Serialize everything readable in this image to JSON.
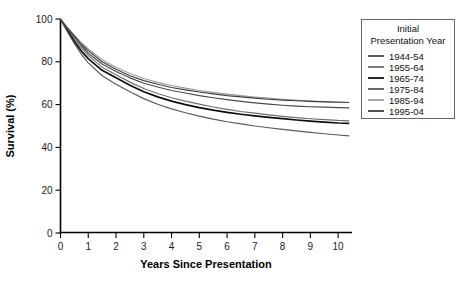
{
  "chart_data": {
    "type": "line",
    "title": "",
    "xlabel": "Years Since Presentation",
    "ylabel": "Survival (%)",
    "xlim": [
      0,
      10.5
    ],
    "ylim": [
      0,
      100
    ],
    "xticks": [
      "0",
      "1",
      "2",
      "3",
      "4",
      "5",
      "6",
      "7",
      "8",
      "9",
      "10"
    ],
    "yticks": [
      "0",
      "20",
      "40",
      "60",
      "80",
      "100"
    ],
    "grid": false,
    "legend_position": "right-outside",
    "legend_title_line1": "Initial",
    "legend_title_line2": "Presentation Year",
    "x": [
      0,
      0.25,
      0.5,
      0.75,
      1,
      1.5,
      2,
      2.5,
      3,
      3.5,
      4,
      4.5,
      5,
      5.5,
      6,
      6.5,
      7,
      7.5,
      8,
      8.5,
      9,
      9.5,
      10,
      10.4
    ],
    "series": [
      {
        "name": "1944-54",
        "color": "#4a4a4a",
        "values": [
          100,
          95.5,
          91.5,
          87.5,
          84.0,
          79.0,
          75.5,
          72.5,
          70.0,
          68.2,
          66.6,
          65.4,
          64.2,
          63.2,
          62.3,
          61.5,
          60.8,
          60.2,
          59.7,
          59.3,
          59.0,
          58.8,
          58.6,
          58.5
        ]
      },
      {
        "name": "1955-64",
        "color": "#6e6e6e",
        "values": [
          100,
          95.0,
          90.5,
          86.5,
          83.0,
          77.5,
          74.0,
          70.5,
          67.5,
          65.2,
          63.2,
          61.6,
          60.2,
          58.9,
          57.8,
          56.8,
          56.0,
          55.2,
          54.5,
          53.9,
          53.4,
          53.0,
          52.6,
          52.4
        ]
      },
      {
        "name": "1965-74",
        "color": "#0d0d0d",
        "values": [
          100,
          94.5,
          89.5,
          85.0,
          81.5,
          76.0,
          72.5,
          69.0,
          66.0,
          63.6,
          61.6,
          60.0,
          58.6,
          57.4,
          56.4,
          55.5,
          54.7,
          54.0,
          53.4,
          52.8,
          52.3,
          51.8,
          51.4,
          51.2
        ]
      },
      {
        "name": "1975-84",
        "color": "#5a5a5a",
        "values": [
          100,
          94.0,
          88.5,
          83.5,
          79.5,
          73.5,
          69.5,
          66.0,
          62.8,
          60.2,
          58.0,
          56.2,
          54.6,
          53.2,
          52.0,
          51.0,
          50.0,
          49.2,
          48.4,
          47.7,
          47.0,
          46.4,
          45.8,
          45.4
        ]
      },
      {
        "name": "1985-94",
        "color": "#9e9e9e",
        "values": [
          100,
          96.0,
          92.5,
          89.0,
          86.0,
          81.0,
          77.5,
          74.5,
          72.2,
          70.4,
          68.9,
          67.7,
          66.6,
          65.7,
          64.9,
          64.2,
          63.5,
          63.0,
          62.5,
          62.1,
          61.7,
          61.4,
          61.2,
          61.0
        ]
      },
      {
        "name": "1995-04",
        "color": "#3f3f3f",
        "values": [
          100,
          95.8,
          92.0,
          88.2,
          85.2,
          80.0,
          76.5,
          73.5,
          71.2,
          69.5,
          68.0,
          66.9,
          65.9,
          65.0,
          64.2,
          63.6,
          63.0,
          62.5,
          62.1,
          61.8,
          61.5,
          61.3,
          61.1,
          61.0
        ]
      }
    ]
  }
}
